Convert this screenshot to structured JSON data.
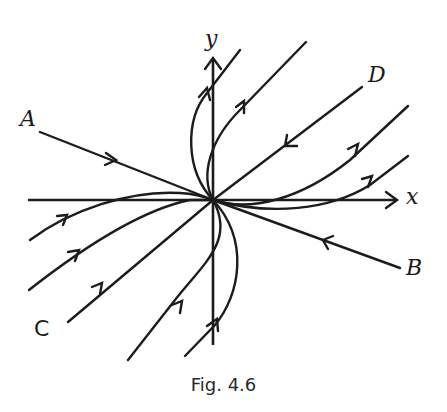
{
  "figure": {
    "caption": "Fig. 4.6",
    "type": "phase-portrait",
    "axes": {
      "x_label": "x",
      "y_label": "y"
    },
    "trajectory_labels": {
      "A": "A",
      "B": "B",
      "C": "C",
      "D": "D"
    },
    "stroke_color": "#1c1c1c",
    "background": "#ffffff"
  }
}
